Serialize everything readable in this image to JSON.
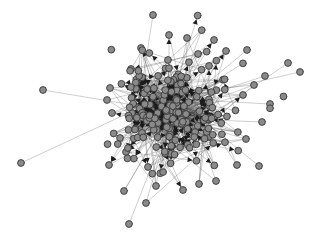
{
  "figure": {
    "title": "",
    "caption": "",
    "background_color": "#ffffff",
    "width": 322,
    "height": 247
  },
  "legend": {
    "visible": false,
    "entries": []
  },
  "axes": {
    "visible": false,
    "xlabel": "",
    "ylabel": "",
    "ticks": []
  },
  "style": {
    "node_fill": "#8a8a8a",
    "node_stroke": "#3a3a3a",
    "node_radius": 3.4,
    "node_stroke_width": 0.9,
    "edge_color": "#6e6e6e",
    "edge_color_dark": "#2e2e2e",
    "edge_width": 0.55,
    "arrow_color": "#1c1c1c",
    "arrow_size": 2.6,
    "background_color": "#ffffff"
  },
  "chart_data": {
    "type": "scatter",
    "subtype": "force-directed-network-graph",
    "title": "",
    "xlabel": "",
    "ylabel": "",
    "directed": true,
    "grid": false,
    "xlim": [
      0,
      322
    ],
    "ylim": [
      0,
      247
    ],
    "node_count": 208,
    "edge_count": 612,
    "core_center": [
      170,
      110
    ],
    "core_radius": 52,
    "halo_radius": 96,
    "nodes": [
      {
        "id": 0,
        "x": 153,
        "y": 15
      },
      {
        "id": 1,
        "x": 21,
        "y": 163
      },
      {
        "id": 2,
        "x": 43,
        "y": 90
      },
      {
        "id": 3,
        "x": 129,
        "y": 224
      },
      {
        "id": 4,
        "x": 288,
        "y": 63
      },
      {
        "id": 5,
        "x": 300,
        "y": 72
      },
      {
        "id": 6,
        "x": 169,
        "y": 35
      },
      {
        "id": 7,
        "x": 141,
        "y": 48
      },
      {
        "id": 8,
        "x": 187,
        "y": 38
      },
      {
        "id": 9,
        "x": 214,
        "y": 40
      },
      {
        "id": 10,
        "x": 226,
        "y": 51
      },
      {
        "id": 11,
        "x": 247,
        "y": 50
      },
      {
        "id": 12,
        "x": 168,
        "y": 60
      },
      {
        "id": 13,
        "x": 131,
        "y": 69
      },
      {
        "id": 14,
        "x": 110,
        "y": 88
      },
      {
        "id": 15,
        "x": 107,
        "y": 100
      },
      {
        "id": 16,
        "x": 112,
        "y": 113
      },
      {
        "id": 17,
        "x": 120,
        "y": 138
      },
      {
        "id": 18,
        "x": 109,
        "y": 165
      },
      {
        "id": 19,
        "x": 124,
        "y": 191
      },
      {
        "id": 20,
        "x": 146,
        "y": 203
      },
      {
        "id": 21,
        "x": 156,
        "y": 186
      },
      {
        "id": 22,
        "x": 183,
        "y": 190
      },
      {
        "id": 23,
        "x": 199,
        "y": 184
      },
      {
        "id": 24,
        "x": 216,
        "y": 181
      },
      {
        "id": 25,
        "x": 237,
        "y": 165
      },
      {
        "id": 26,
        "x": 259,
        "y": 166
      },
      {
        "id": 27,
        "x": 246,
        "y": 139
      },
      {
        "id": 28,
        "x": 262,
        "y": 122
      },
      {
        "id": 29,
        "x": 270,
        "y": 104
      },
      {
        "id": 30,
        "x": 254,
        "y": 85
      },
      {
        "id": 31,
        "x": 265,
        "y": 76
      },
      {
        "id": 32,
        "x": 243,
        "y": 95
      },
      {
        "id": 33,
        "x": 209,
        "y": 66
      },
      {
        "id": 34,
        "x": 198,
        "y": 54
      },
      {
        "id": 35,
        "x": 132,
        "y": 113
      },
      {
        "id": 36,
        "x": 126,
        "y": 152
      },
      {
        "id": 37,
        "x": 148,
        "y": 167
      }
    ],
    "note": "Nodes listed are identifiable peripheral vertices; the dense core contains ~170 additional overlapping vertices generated by the layout."
  }
}
